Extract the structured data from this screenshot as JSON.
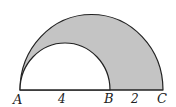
{
  "diagram": {
    "type": "geometry-semicircles",
    "points": [
      {
        "name": "A",
        "label": "A"
      },
      {
        "name": "B",
        "label": "B"
      },
      {
        "name": "C",
        "label": "C"
      }
    ],
    "segments": [
      {
        "from": "A",
        "to": "B",
        "length_label": "4"
      },
      {
        "from": "B",
        "to": "C",
        "length_label": "2"
      }
    ],
    "shapes": {
      "outer_semicircle": {
        "diameter": "AC",
        "fill": "#c4c4c4"
      },
      "inner_semicircle": {
        "diameter": "AB",
        "fill": "#ffffff"
      }
    },
    "colors": {
      "shaded_region": "#c4c4c4",
      "stroke": "#222222"
    }
  }
}
